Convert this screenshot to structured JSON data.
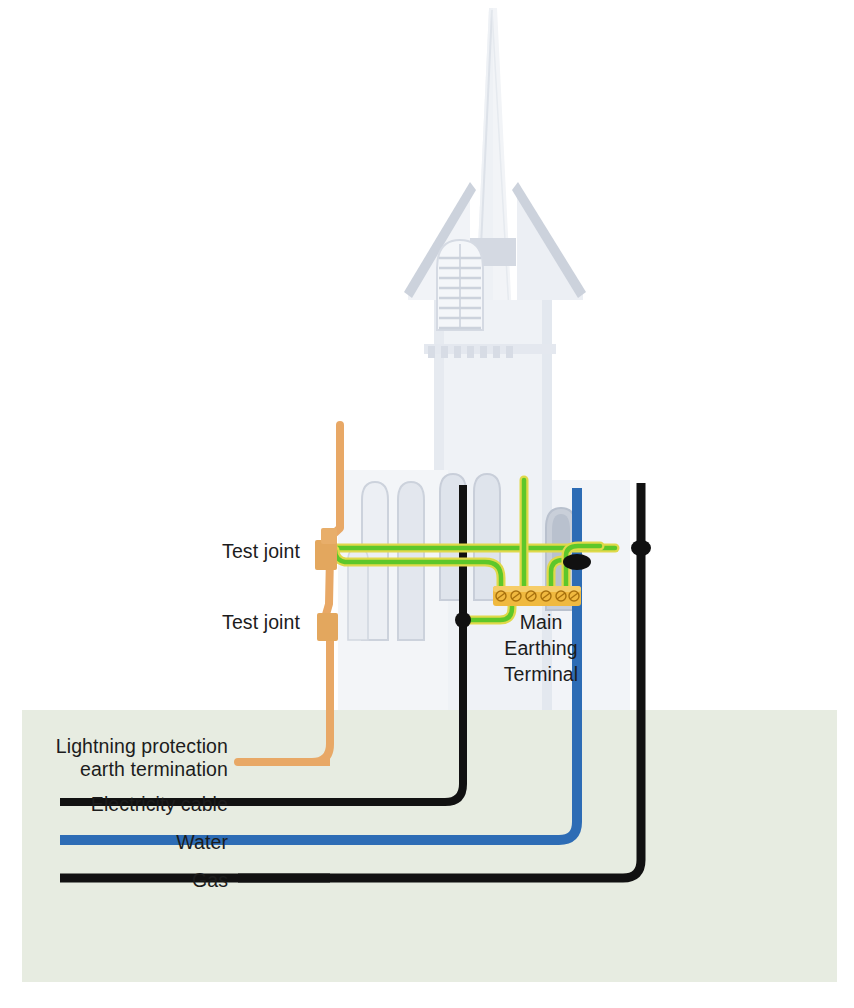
{
  "figure": {
    "background_color": "#ffffff",
    "ground": {
      "label": "ground-soil-band",
      "color": "#e7ece1",
      "top_y": 710
    }
  },
  "building": {
    "name": "church-with-spire",
    "silhouette_color": "#e9ecf1",
    "detail_color": "#ccd2dc"
  },
  "labels": {
    "test_joint_upper": "Test joint",
    "test_joint_lower": "Test joint",
    "main_earthing_terminal_line1": "Main",
    "main_earthing_terminal_line2": "Earthing",
    "main_earthing_terminal_line3": "Terminal",
    "lightning_line1": "Lightning protection",
    "lightning_line2": "earth termination",
    "electricity": "Electricity cable",
    "water": "Water",
    "gas": "Gas"
  },
  "legend": [
    {
      "key": "lightning",
      "label_line1": "Lightning protection",
      "label_line2": "earth termination",
      "color": "#e8a866"
    },
    {
      "key": "electricity",
      "label_line1": "Electricity cable",
      "label_line2": "",
      "color": "#111111"
    },
    {
      "key": "water",
      "label_line1": "Water",
      "label_line2": "",
      "color": "#2d6cb5"
    },
    {
      "key": "gas",
      "label_line1": "Gas",
      "label_line2": "",
      "color": "#111111"
    }
  ],
  "colors": {
    "lightning_conductor": "#e8a866",
    "test_joint": "#e3a75e",
    "earth_conductor_core": "#5dc72a",
    "earth_conductor_edge": "#e0d94a",
    "electricity_cable": "#111111",
    "water_pipe": "#2d6cb5",
    "gas_pipe": "#111111",
    "terminal_bar": "#f0b93f",
    "terminal_screw": "#c98a1e",
    "clamp": "#111111",
    "text": "#1c1c1c",
    "ground": "#e7ece1"
  },
  "terminal_block": {
    "name": "main-earthing-terminal-bar",
    "screw_count": 6,
    "x": 495,
    "y": 588,
    "width": 84,
    "height": 18
  },
  "bonding_clamps": [
    {
      "name": "clamp-gas-pipe",
      "x": 641,
      "y": 548
    },
    {
      "name": "clamp-water-pipe",
      "x": 577,
      "y": 563
    },
    {
      "name": "clamp-electricity-cable",
      "x": 463,
      "y": 620
    }
  ],
  "test_joints": [
    {
      "name": "test-joint-upper",
      "x": 315,
      "y": 540,
      "width": 22,
      "height": 28
    },
    {
      "name": "test-joint-lower",
      "x": 317,
      "y": 617,
      "width": 20,
      "height": 26
    }
  ]
}
